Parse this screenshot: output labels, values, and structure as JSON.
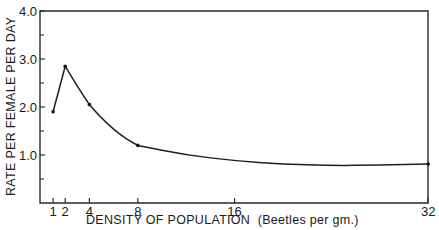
{
  "chart_data": {
    "type": "line",
    "title": "",
    "xlabel": "DENSITY OF POPULATION  (Beetles per gm.)",
    "ylabel": "RATE PER FEMALE PER DAY",
    "xlim": [
      0,
      32
    ],
    "ylim": [
      0,
      4.0
    ],
    "x_ticks": [
      1,
      2,
      4,
      8,
      16,
      32
    ],
    "x_tick_labels": [
      "1",
      "2",
      "4",
      "8",
      "16",
      "32"
    ],
    "y_ticks": [
      1.0,
      2.0,
      3.0,
      4.0
    ],
    "y_tick_labels": [
      "1.0",
      "2.0",
      "3.0",
      "4.0"
    ],
    "y_minor_ticks": [
      0.5,
      1.5,
      2.5,
      3.5
    ],
    "grid": false,
    "legend": null,
    "series": [
      {
        "name": "Rate per female per day",
        "points": [
          {
            "x": 1,
            "y": 1.9
          },
          {
            "x": 2,
            "y": 2.85
          },
          {
            "x": 4,
            "y": 2.05
          },
          {
            "x": 8,
            "y": 1.2
          },
          {
            "x": 32,
            "y": 0.81
          }
        ],
        "smoothed_curve": [
          {
            "x": 8,
            "y": 1.2
          },
          {
            "x": 12,
            "y": 1.0
          },
          {
            "x": 16,
            "y": 0.88
          },
          {
            "x": 20,
            "y": 0.81
          },
          {
            "x": 24,
            "y": 0.78
          },
          {
            "x": 28,
            "y": 0.79
          },
          {
            "x": 32,
            "y": 0.81
          }
        ]
      }
    ]
  }
}
